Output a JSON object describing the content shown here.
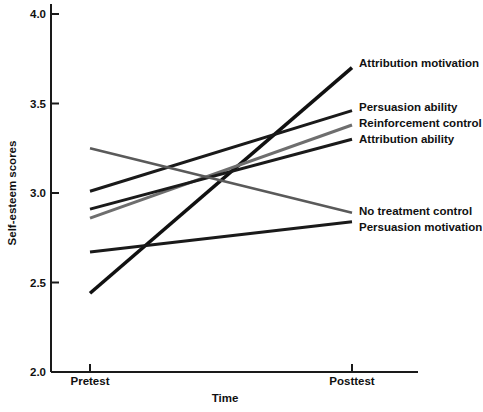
{
  "chart_data": {
    "type": "line",
    "title": "",
    "xlabel": "Time",
    "ylabel": "Self-esteem scores",
    "categories": [
      "Pretest",
      "Posttest"
    ],
    "x": [
      0,
      1
    ],
    "xtick_labels": [
      "Pretest",
      "Posttest"
    ],
    "ytick_labels": [
      "2.0",
      "2.5",
      "3.0",
      "3.5",
      "4.0"
    ],
    "yticks": [
      2.0,
      2.5,
      3.0,
      3.5,
      4.0
    ],
    "ylim": [
      2.0,
      4.0
    ],
    "xlim": [
      0,
      1
    ],
    "grid": false,
    "legend_position": "inline-right-of-line-ends",
    "series": [
      {
        "name": "Attribution motivation",
        "label": "Attribution motivation",
        "values": [
          2.44,
          3.7
        ],
        "color": "#111111",
        "width": 3.6
      },
      {
        "name": "Persuasion ability",
        "label": "Persuasion ability",
        "values": [
          3.01,
          3.46
        ],
        "color": "#1a1a1a",
        "width": 3.0
      },
      {
        "name": "Reinforcement control",
        "label": "Reinforcement control",
        "values": [
          2.86,
          3.38
        ],
        "color": "#6e6e6e",
        "width": 3.0
      },
      {
        "name": "Attribution ability",
        "label": "Attribution ability",
        "values": [
          2.91,
          3.3
        ],
        "color": "#1a1a1a",
        "width": 3.0
      },
      {
        "name": "No treatment control",
        "label": "No treatment control",
        "values": [
          3.25,
          2.89
        ],
        "color": "#5a5a5a",
        "width": 2.6
      },
      {
        "name": "Persuasion motivation",
        "label": "Persuasion motivation",
        "values": [
          2.67,
          2.84
        ],
        "color": "#1a1a1a",
        "width": 3.0
      }
    ]
  },
  "axes": {
    "y_title": "Self-esteem scores",
    "x_title": "Time",
    "y_tick_0": "2.0",
    "y_tick_1": "2.5",
    "y_tick_2": "3.0",
    "y_tick_3": "3.5",
    "y_tick_4": "4.0",
    "x_tick_0": "Pretest",
    "x_tick_1": "Posttest"
  },
  "labels": {
    "attribution_motivation": "Attribution motivation",
    "persuasion_ability": "Persuasion ability",
    "reinforcement_control": "Reinforcement control",
    "attribution_ability": "Attribution ability",
    "no_treatment_control": "No treatment control",
    "persuasion_motivation": "Persuasion motivation"
  },
  "colors": {
    "ink": "#111111",
    "gray_line": "#6e6e6e",
    "background": "#ffffff"
  }
}
